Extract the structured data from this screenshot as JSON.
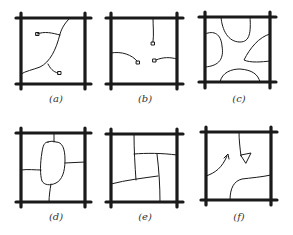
{
  "figure": {
    "background": "#ffffff",
    "ink_color": "#1a1a1a",
    "panels": [
      {
        "id": "a",
        "label": "(a)",
        "description": "Square frame with a branching path; two paths end in small squares inside the frame"
      },
      {
        "id": "b",
        "label": "(b)",
        "description": "Square frame with three short paths from edges ending in small squares near center"
      },
      {
        "id": "c",
        "label": "(c)",
        "description": "Square frame with four curved bulges from each edge leaving an open cross-shaped center"
      },
      {
        "id": "d",
        "label": "(d)",
        "description": "Square frame with a central rounded rectangle connected to each of the four edges"
      },
      {
        "id": "e",
        "label": "(e)",
        "description": "Square frame subdivided into pinwheel pattern of four rooms around a central square"
      },
      {
        "id": "f",
        "label": "(f)",
        "description": "Square frame with a path from top ending in a triangle, an arrow from left edge, and a curve from right edge to bottom"
      }
    ]
  }
}
